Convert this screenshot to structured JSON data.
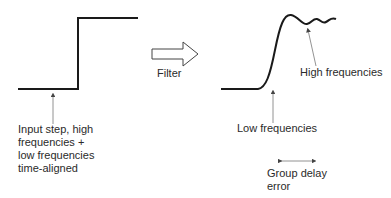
{
  "diagram": {
    "input_label": [
      "Input step, high",
      "frequencies +",
      "low frequencies",
      "time-aligned"
    ],
    "filter_label": "Filter",
    "high_freq_label": "High frequencies",
    "low_freq_label": "Low frequencies",
    "group_delay_label": [
      "Group delay",
      "error"
    ],
    "line_color": "#1a1a1a",
    "arrow_color": "#555555"
  }
}
